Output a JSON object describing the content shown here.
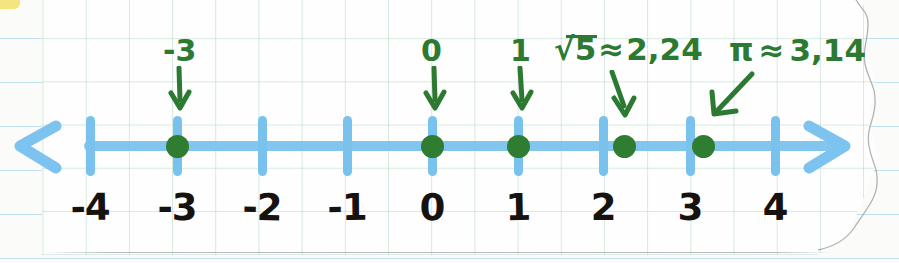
{
  "scene": {
    "kind": "hand-drawn-number-line",
    "medium": "grid-paper-over-ruled-notebook"
  },
  "colors": {
    "axis_blue": "#7cc3ef",
    "annotation_green": "#2c7a32",
    "point_green": "#2f7d30",
    "numeral_black": "#15120f",
    "grid_green": "#96c8aa",
    "rule_blue": "#bfe0f2"
  },
  "number_line": {
    "tick_labels": [
      "-4",
      "-3",
      "-2",
      "-1",
      "0",
      "1",
      "2",
      "3",
      "4"
    ],
    "tick_values": [
      -4,
      -3,
      -2,
      -1,
      0,
      1,
      2,
      3,
      4
    ],
    "tick_x": [
      90,
      177,
      262,
      347,
      432,
      518,
      603,
      690,
      775
    ],
    "label_x": [
      90,
      177,
      262,
      347,
      432,
      518,
      603,
      690,
      775
    ],
    "left_arrow_icon": "arrow-left",
    "right_arrow_icon": "arrow-right",
    "axis_y": 146
  },
  "plotted_points": [
    {
      "label": "-3",
      "value": -3,
      "x": 177,
      "arrow": "down",
      "label_x": 177,
      "label_y": 36,
      "arrow_x": 177,
      "arrow_y": 70
    },
    {
      "label": "0",
      "value": 0,
      "x": 432,
      "arrow": "down",
      "label_x": 432,
      "label_y": 36,
      "arrow_x": 432,
      "arrow_y": 70
    },
    {
      "label": "1",
      "value": 1,
      "x": 518,
      "arrow": "down",
      "label_x": 518,
      "label_y": 36,
      "arrow_x": 518,
      "arrow_y": 70
    },
    {
      "label": "√5 ≈ 2,24",
      "value": 2.24,
      "x": 624,
      "arrow": "down-slight",
      "label_x": 630,
      "label_y": 35,
      "arrow_x": 618,
      "arrow_y": 72
    },
    {
      "label": "π ≈ 3,14",
      "value": 3.14,
      "x": 703,
      "arrow": "down-left",
      "label_x": 786,
      "label_y": 36,
      "arrow_x": 716,
      "arrow_y": 72
    }
  ],
  "annotations": {
    "sqrt5": {
      "radical": "√",
      "radicand": "5",
      "relation": "≈",
      "approx": "2,24"
    },
    "pi": {
      "symbol": "π",
      "relation": "≈",
      "approx": "3,14"
    }
  }
}
